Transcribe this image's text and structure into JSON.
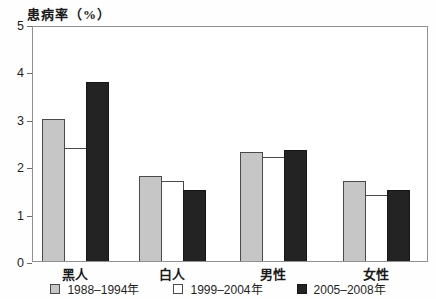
{
  "chart_data": {
    "type": "bar",
    "title": "患病率（%）",
    "ylabel": "患病率（%）",
    "xlabel": "",
    "categories": [
      "黑人",
      "白人",
      "男性",
      "女性"
    ],
    "series": [
      {
        "name": "1988–1994年",
        "color": "#c6c6c6",
        "border": "#4a4a4a",
        "values": [
          3.0,
          1.8,
          2.3,
          1.7
        ]
      },
      {
        "name": "1999–2004年",
        "color": "#ffffff",
        "border": "#4a4a4a",
        "values": [
          2.4,
          1.7,
          2.2,
          1.4
        ]
      },
      {
        "name": "2005–2008年",
        "color": "#232323",
        "border": "#161616",
        "values": [
          3.8,
          1.5,
          2.35,
          1.5
        ]
      }
    ],
    "ylim": [
      0,
      5
    ],
    "yticks": [
      0,
      1,
      2,
      3,
      4,
      5
    ],
    "grid": false,
    "legend_position": "bottom",
    "frame_color": "#909090"
  }
}
